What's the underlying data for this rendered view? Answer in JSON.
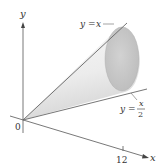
{
  "figure": {
    "type": "solid-of-revolution",
    "axes": {
      "y_label": "y",
      "x_label": "x",
      "origin_label": "0",
      "x_tick_label": "12"
    },
    "curves": [
      {
        "name": "upper-line",
        "label_lhs": "y =",
        "label_rhs": "x",
        "equation": "y = x"
      },
      {
        "name": "lower-line",
        "label_lhs": "y =",
        "label_num": "x",
        "label_den": "2",
        "equation": "y = x/2"
      }
    ],
    "colors": {
      "axis": "#444444",
      "line": "#666666",
      "cone_light": "#f4f4f4",
      "cone_shade": "#d8d8d8",
      "disc": "#c8c8c8"
    }
  }
}
